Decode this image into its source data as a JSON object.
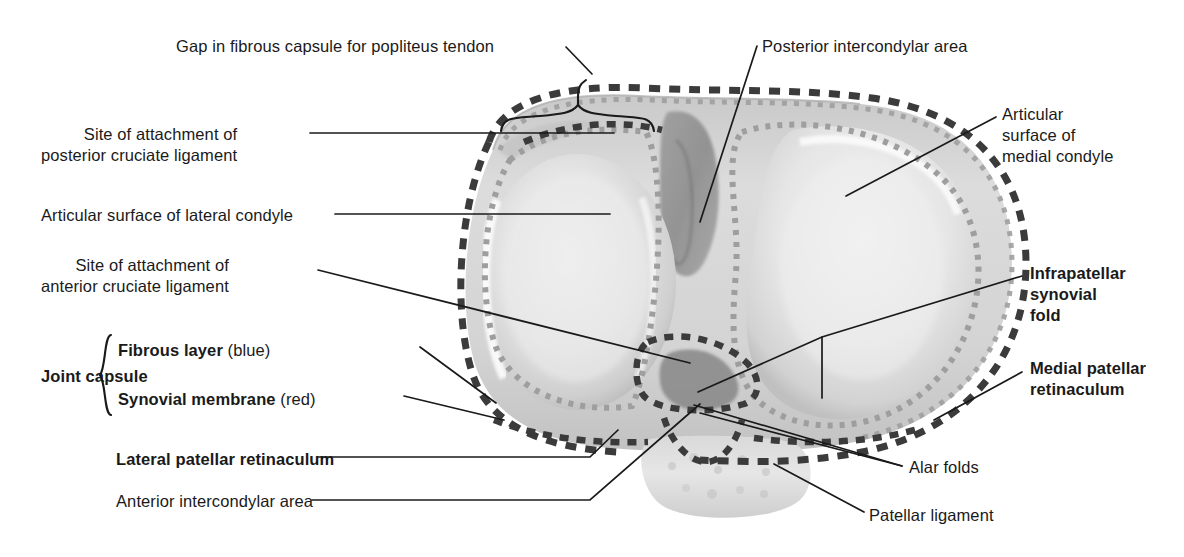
{
  "figure": {
    "type": "anatomical-illustration",
    "colors": {
      "fibrous_layer_dash": "#3b3b3b",
      "synovial_membrane_dash": "#9a9a9a",
      "leader_line": "#1a1a1a",
      "background": "#ffffff",
      "bone_light": "#ededed",
      "bone_mid": "#d6d6d6",
      "bone_dark": "#8e8e8e"
    }
  },
  "labels": {
    "gap_popliteus": "Gap in fibrous capsule for popliteus tendon",
    "posterior_intercondylar": "Posterior intercondylar area",
    "articular_medial": [
      "Articular",
      "surface of",
      "medial condyle"
    ],
    "site_attachment_1": "Site of attachment of",
    "posterior_cruciate_ligament": "posterior cruciate ligament",
    "articular_lateral": "Articular surface of lateral condyle",
    "site_attachment_2": "Site of attachment of",
    "anterior_cruciate_ligament": "anterior cruciate ligament",
    "joint_capsule": "Joint capsule",
    "fibrous_layer": "Fibrous layer",
    "fibrous_layer_note": "(blue)",
    "synovial_membrane": "Synovial membrane",
    "synovial_membrane_note": "(red)",
    "infrapatellar_synovial_fold": [
      "Infrapatellar",
      "synovial",
      "fold"
    ],
    "medial_patellar_retinaculum": [
      "Medial patellar",
      "retinaculum"
    ],
    "lateral_patellar_retinaculum": "Lateral patellar retinaculum",
    "anterior_intercondylar": "Anterior intercondylar area",
    "alar_folds": "Alar folds",
    "patellar_ligament": "Patellar ligament"
  }
}
